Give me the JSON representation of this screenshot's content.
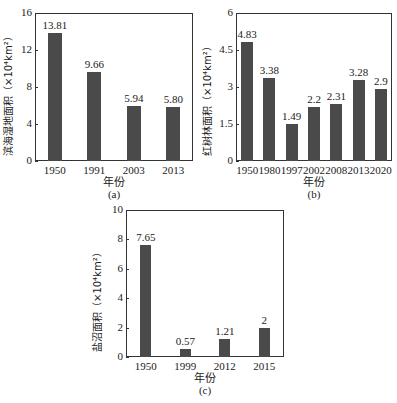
{
  "chart_data": [
    {
      "id": "a",
      "type": "bar",
      "categories": [
        "1950",
        "1991",
        "2003",
        "2013"
      ],
      "values": [
        13.81,
        9.66,
        5.94,
        5.8
      ],
      "value_labels": [
        "13.81",
        "9.66",
        "5.94",
        "5.80"
      ],
      "title": "",
      "xlabel": "年份",
      "ylabel": "滨海湿地面积（×10⁴km²）",
      "yticks": [
        "0",
        "4",
        "8",
        "12",
        "16"
      ],
      "ylim": [
        0,
        16
      ],
      "caption": "(a)",
      "bar_color": "#4a4a4a",
      "grid": false
    },
    {
      "id": "b",
      "type": "bar",
      "categories": [
        "1950",
        "1980",
        "1997",
        "2002",
        "2008",
        "2013",
        "2020"
      ],
      "values": [
        4.83,
        3.38,
        1.49,
        2.2,
        2.31,
        3.28,
        2.9
      ],
      "value_labels": [
        "4.83",
        "3.38",
        "1.49",
        "2.2",
        "2.31",
        "3.28",
        "2.9"
      ],
      "title": "",
      "xlabel": "年份",
      "ylabel": "红树林面积（×10⁴km²）",
      "yticks": [
        "0",
        "1.5",
        "3",
        "4.5",
        "6"
      ],
      "ylim": [
        0,
        6
      ],
      "caption": "(b)",
      "bar_color": "#4a4a4a",
      "grid": false
    },
    {
      "id": "c",
      "type": "bar",
      "categories": [
        "1950",
        "1999",
        "2012",
        "2015"
      ],
      "values": [
        7.65,
        0.57,
        1.21,
        2
      ],
      "value_labels": [
        "7.65",
        "0.57",
        "1.21",
        "2"
      ],
      "title": "",
      "xlabel": "年份",
      "ylabel": "盐沼面积（×10⁴km²）",
      "yticks": [
        "0",
        "2",
        "4",
        "6",
        "8",
        "10"
      ],
      "ylim": [
        0,
        10
      ],
      "caption": "(c)",
      "bar_color": "#4a4a4a",
      "grid": false
    }
  ]
}
